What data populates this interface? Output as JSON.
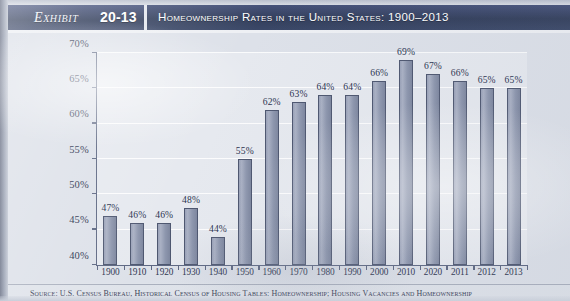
{
  "header": {
    "exhibit_word": "Exhibit",
    "exhibit_number": "20-13",
    "title": "Homeownership Rates in the United States: 1900–2013"
  },
  "source": {
    "text": "Source: U.S. Census Bureau, Historical Census of Housing Tables: Homeownership; Housing Vacancies and Homeownership"
  },
  "colors": {
    "header_navy": "#3b4868",
    "bar_fill": "#9aa2b8",
    "bar_border": "#4e5770",
    "plot_background": "#e6e9ef",
    "page_background": "#dde1e9",
    "axis_line": "#5d6782",
    "text": "#2d3550"
  },
  "chart_data": {
    "type": "bar",
    "title": "Homeownership Rates in the United States: 1900–2013",
    "xlabel": "",
    "ylabel": "",
    "categories": [
      "1900",
      "1910",
      "1920",
      "1930",
      "1940",
      "1950",
      "1960",
      "1970",
      "1980",
      "1990",
      "2000",
      "2010",
      "2020",
      "2011",
      "2012",
      "2013"
    ],
    "values": [
      47,
      46,
      46,
      48,
      44,
      55,
      62,
      63,
      64,
      64,
      66,
      69,
      67,
      66,
      65,
      65
    ],
    "data_labels": [
      "47%",
      "46%",
      "46%",
      "48%",
      "44%",
      "55%",
      "62%",
      "63%",
      "64%",
      "64%",
      "66%",
      "69%",
      "67%",
      "66%",
      "65%",
      "65%"
    ],
    "ylim": [
      40,
      70
    ],
    "ytick_values": [
      40,
      45,
      50,
      55,
      60,
      65,
      70
    ],
    "ytick_labels": [
      "40%",
      "45%",
      "50%",
      "55%",
      "60%",
      "65%",
      "70%"
    ],
    "grid": true,
    "legend": false,
    "units": "percent"
  }
}
